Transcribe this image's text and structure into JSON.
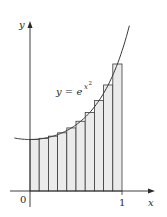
{
  "chart_data": {
    "type": "bar",
    "subtype": "riemann-sum-midpoint",
    "title": "",
    "curve_label": "y = e^(x^2)",
    "curve_label_parts": {
      "base": "y = e",
      "exponent": "x",
      "exp_power": "2"
    },
    "xlabel": "x",
    "ylabel": "y",
    "x_tick_labels": [
      "0",
      "1"
    ],
    "x_ticks": [
      0,
      1
    ],
    "xlim": [
      -0.2,
      1.3
    ],
    "ylim": [
      0,
      3.3
    ],
    "grid": false,
    "legend": "none",
    "n_rectangles": 10,
    "categories": [
      "0.05",
      "0.15",
      "0.25",
      "0.35",
      "0.45",
      "0.55",
      "0.65",
      "0.75",
      "0.85",
      "0.95"
    ],
    "x_left": [
      0.0,
      0.1,
      0.2,
      0.3,
      0.4,
      0.5,
      0.6,
      0.7,
      0.8,
      0.9
    ],
    "bar_width": 0.1,
    "values": [
      1.003,
      1.023,
      1.065,
      1.13,
      1.225,
      1.354,
      1.526,
      1.755,
      2.059,
      2.466
    ],
    "curve": {
      "function": "exp(x^2)",
      "x_range": [
        -0.17,
        1.08
      ]
    },
    "colors": {
      "bar_fill": "#ebebeb",
      "bar_stroke": "#3a3a3a",
      "curve": "#3a3a3a",
      "axis": "#2b2b2b"
    }
  }
}
